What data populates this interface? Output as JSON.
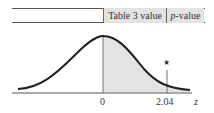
{
  "table": {
    "columns": [
      "Table 3 value",
      "p-value"
    ],
    "col1": "Table 3 value",
    "col2_italic": "p",
    "col2_rest": "-value"
  },
  "diagram": {
    "type": "standard normal curve",
    "shaded_region": "right of 0",
    "axis_labels": {
      "zero": "0",
      "test_stat": "2.04",
      "axis": "z"
    },
    "marker": "★",
    "colors": {
      "shade": "#e3e3e3",
      "curve": "#222222",
      "lines": "#555555"
    }
  }
}
